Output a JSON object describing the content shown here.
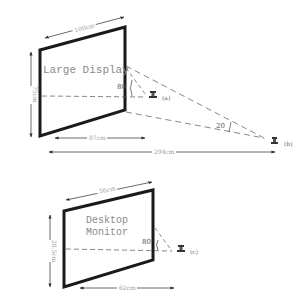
{
  "figure": {
    "large_display": {
      "label": "Large Display",
      "width_label": "100cm",
      "height_label": "75cm",
      "near_distance_label": "87cm",
      "far_distance_label": "294cm",
      "near_angle": "80",
      "far_angle": "20",
      "near_viewer": "(a)",
      "far_viewer": "(b)"
    },
    "desktop_monitor": {
      "label_line1": "Desktop",
      "label_line2": "Monitor",
      "width_label": "56cm",
      "height_label": "28.5cm",
      "distance_label": "62cm",
      "angle": "80",
      "viewer": "(c)"
    },
    "colors": {
      "frame": "#1a1a1a",
      "dashes": "#555555",
      "dimension": "#444444",
      "text": "#888888"
    }
  }
}
